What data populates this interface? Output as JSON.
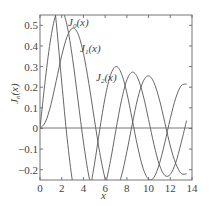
{
  "chart_data": {
    "type": "line",
    "title": "",
    "xlabel": "x",
    "ylabel": "J_n(x)",
    "xlim": [
      0,
      14
    ],
    "ylim": [
      -0.25,
      0.55
    ],
    "xticks": [
      0,
      2,
      4,
      6,
      8,
      10,
      12,
      14
    ],
    "yticks": [
      -0.2,
      -0.1,
      0,
      0.1,
      0.2,
      0.3,
      0.4,
      0.5
    ],
    "ytick_labels": [
      "−0.2",
      "−0.1",
      "0",
      "0.1",
      "0.2",
      "0.3",
      "0.4",
      "0.5"
    ],
    "grid": false,
    "legend": "inline labels",
    "x": [
      0,
      0.5,
      1,
      1.5,
      2,
      2.5,
      3,
      3.5,
      4,
      4.5,
      5,
      5.5,
      6,
      6.5,
      7,
      7.5,
      8,
      8.5,
      9,
      9.5,
      10,
      10.5,
      11,
      11.5,
      12,
      12.5,
      13,
      13.5
    ],
    "series": [
      {
        "name": "J0(x)",
        "label_main": "J",
        "label_sub": "0",
        "label_tail": "(x)",
        "values": [
          1,
          0.938,
          0.765,
          0.512,
          0.224,
          -0.048,
          -0.26,
          -0.38,
          -0.397,
          -0.321,
          -0.178,
          -0.007,
          0.151,
          0.26,
          0.3,
          0.266,
          0.172,
          0.042,
          -0.09,
          -0.194,
          -0.246,
          -0.237,
          -0.171,
          -0.068,
          0.048,
          0.147,
          0.207,
          0.215
        ]
      },
      {
        "name": "J1(x)",
        "label_main": "J",
        "label_sub": "1",
        "label_tail": "(x)",
        "values": [
          0,
          0.242,
          0.44,
          0.558,
          0.577,
          0.497,
          0.339,
          0.137,
          -0.066,
          -0.231,
          -0.328,
          -0.341,
          -0.277,
          -0.154,
          -0.005,
          0.135,
          0.235,
          0.273,
          0.245,
          0.161,
          0.043,
          -0.079,
          -0.177,
          -0.228,
          -0.223,
          -0.166,
          -0.07,
          0.038
        ]
      },
      {
        "name": "J2(x)",
        "label_main": "J",
        "label_sub": "2",
        "label_tail": "(x)",
        "values": [
          0,
          0.031,
          0.115,
          0.232,
          0.353,
          0.446,
          0.486,
          0.459,
          0.364,
          0.218,
          0.047,
          -0.117,
          -0.243,
          -0.307,
          -0.301,
          -0.23,
          -0.113,
          0.022,
          0.145,
          0.228,
          0.255,
          0.222,
          0.139,
          0.028,
          -0.085,
          -0.17,
          -0.218,
          -0.22
        ]
      }
    ]
  },
  "labels": {
    "x_axis": "x",
    "y_axis_main": "J",
    "y_axis_sub": "n",
    "y_axis_tail": "(x)"
  }
}
